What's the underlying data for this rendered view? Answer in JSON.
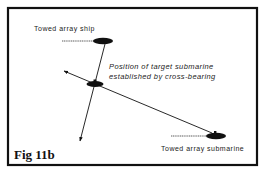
{
  "figure": {
    "label": "Fig 11b",
    "colors": {
      "frame": "#111111",
      "background": "#ffffff",
      "ink": "#111111"
    }
  },
  "labels": {
    "ship": "Towed array ship",
    "target_line1": "Position of target submarine",
    "target_line2": "established by cross-bearing",
    "submarine": "Towed array submarine"
  }
}
